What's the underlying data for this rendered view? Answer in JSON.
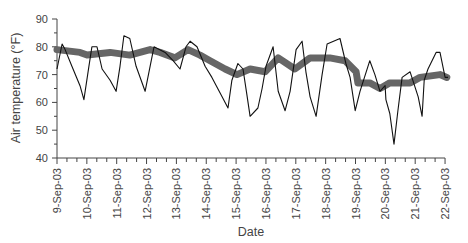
{
  "chart_data": {
    "type": "line",
    "title": "",
    "xlabel": "Date",
    "ylabel": "Air temperature (°F)",
    "ylim": [
      40,
      90
    ],
    "yticks": [
      40,
      50,
      60,
      70,
      80,
      90
    ],
    "xticks": [
      "9-Sep-03",
      "10-Sep-03",
      "11-Sep-03",
      "12-Sep-03",
      "13-Sep-03",
      "14-Sep-03",
      "15-Sep-03",
      "16-Sep-03",
      "17-Sep-03",
      "18-Sep-03",
      "19-Sep-03",
      "20-Sep-03",
      "21-Sep-03",
      "22-Sep-03"
    ],
    "grid": false,
    "legend": null,
    "series": [
      {
        "name": "Air temperature",
        "style": "thin-line",
        "color": "#111111",
        "x_day_offset": [
          0,
          0.17,
          0.27,
          0.5,
          0.77,
          0.9,
          1.07,
          1.17,
          1.34,
          1.51,
          1.78,
          1.98,
          2.11,
          2.24,
          2.44,
          2.65,
          2.95,
          3.12,
          3.25,
          3.62,
          3.89,
          4.12,
          4.32,
          4.46,
          4.69,
          4.96,
          5.19,
          5.53,
          5.73,
          5.86,
          6.06,
          6.23,
          6.36,
          6.47,
          6.73,
          6.87,
          7.0,
          7.24,
          7.41,
          7.64,
          7.81,
          8.01,
          8.21,
          8.34,
          8.48,
          8.68,
          8.88,
          9.05,
          9.48,
          9.68,
          9.82,
          9.99,
          10.15,
          10.48,
          10.65,
          10.82,
          10.99,
          11.02,
          11.15,
          11.29,
          11.42,
          11.56,
          11.83,
          12.1,
          12.23,
          12.3,
          12.43,
          12.7,
          12.83,
          13.0,
          13.1
        ],
        "values": [
          72,
          81,
          79,
          73,
          66,
          61,
          73,
          80,
          80,
          72,
          68,
          64,
          73,
          84,
          83,
          73,
          64,
          73,
          80,
          78,
          75,
          72,
          80,
          82,
          80,
          73,
          69,
          62,
          58,
          68,
          74,
          72,
          63,
          55,
          58,
          65,
          73,
          80,
          64,
          57,
          64,
          79,
          82,
          71,
          62,
          55,
          70,
          81,
          83,
          74,
          69,
          57,
          64,
          75,
          70,
          64,
          66,
          61,
          56,
          45,
          57,
          69,
          71,
          62,
          55,
          68,
          72,
          78,
          78,
          69,
          69
        ]
      },
      {
        "name": "Smoothed / mean temperature",
        "style": "thick-dots",
        "color": "#666666",
        "x_day_offset": [
          0,
          0.77,
          1.01,
          1.78,
          2.44,
          3.12,
          3.45,
          3.95,
          4.39,
          4.79,
          5.13,
          5.63,
          6.03,
          6.47,
          6.97,
          7.41,
          7.97,
          8.48,
          9.14,
          9.65,
          10.02,
          10.08,
          10.48,
          10.82,
          11.15,
          11.83,
          12.16,
          12.83,
          13.06
        ],
        "values": [
          79,
          78,
          77,
          78,
          77,
          79,
          78,
          76,
          79,
          77,
          75,
          72,
          70,
          72,
          71,
          76,
          72,
          76,
          76,
          75,
          71,
          67,
          67,
          65,
          67,
          67,
          69,
          70,
          69
        ]
      }
    ]
  }
}
